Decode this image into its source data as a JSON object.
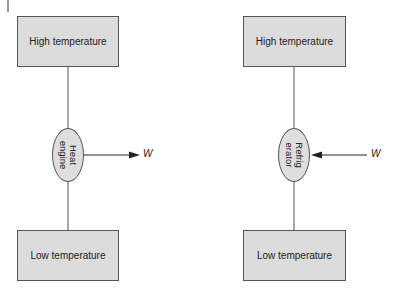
{
  "diagram": {
    "left": {
      "title": "Heat engine",
      "top_box": "High temperature",
      "device": "Heat\nengine",
      "bottom_box": "Low temperature",
      "work_label": "W",
      "work_direction": "out"
    },
    "right": {
      "title": "Refrigerator",
      "top_box": "High temperature",
      "device": "Refrig\nerator",
      "bottom_box": "Low temperature",
      "work_label": "W",
      "work_direction": "in"
    },
    "colors": {
      "box_fill": "#dcdcdc",
      "stroke": "#555555",
      "text": "#222222"
    }
  }
}
